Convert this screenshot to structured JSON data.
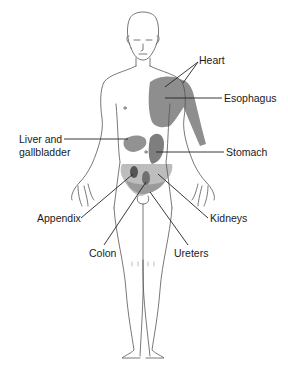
{
  "diagram": {
    "type": "anatomical referred-pain map",
    "colors": {
      "outline": "#555555",
      "shade_light": "#b8b8b8",
      "shade_mid": "#8c8c8c",
      "shade_dark": "#5e5e5e",
      "leader": "#222222",
      "text": "#1a1a1a"
    },
    "labels": {
      "heart": "Heart",
      "esophagus": "Esophagus",
      "liver_line1": "Liver and",
      "liver_line2": "gallbladder",
      "stomach": "Stomach",
      "appendix": "Appendix",
      "kidneys": "Kidneys",
      "colon": "Colon",
      "ureters": "Ureters"
    }
  }
}
